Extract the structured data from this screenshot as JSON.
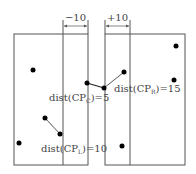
{
  "diagram": {
    "colors": {
      "line": "#555555",
      "point": "#000000",
      "text": "#444444"
    },
    "left_region": {
      "x": 14,
      "y": 34,
      "w": 74,
      "h": 131,
      "strip_x": 63
    },
    "right_region": {
      "x": 105,
      "y": 34,
      "w": 80,
      "h": 131,
      "strip_x": 130
    },
    "dimensions": [
      {
        "label": "−10",
        "x1": 63,
        "x2": 88,
        "y": 26
      },
      {
        "label": "+10",
        "x1": 105,
        "x2": 130,
        "y": 26
      }
    ],
    "labels": {
      "center": {
        "main": "dist(CP",
        "sub": "C",
        "tail": ")=5"
      },
      "right": {
        "main": "dist(CP",
        "sub": "R",
        "tail": ")=15"
      },
      "left": {
        "main": "dist(CP",
        "sub": "L",
        "tail": ")=10"
      }
    },
    "points": [
      {
        "x": 33,
        "y": 70
      },
      {
        "x": 87,
        "y": 83
      },
      {
        "x": 104,
        "y": 88
      },
      {
        "x": 124,
        "y": 72
      },
      {
        "x": 174,
        "y": 80
      },
      {
        "x": 176,
        "y": 46
      },
      {
        "x": 45,
        "y": 118
      },
      {
        "x": 60,
        "y": 134
      },
      {
        "x": 19,
        "y": 143
      },
      {
        "x": 122,
        "y": 146
      }
    ],
    "pairs": [
      {
        "name": "CP_C",
        "a": [
          87,
          83
        ],
        "b": [
          104,
          88
        ]
      },
      {
        "name": "CP_R",
        "a": [
          104,
          88
        ],
        "b": [
          124,
          72
        ]
      },
      {
        "name": "CP_L",
        "a": [
          45,
          118
        ],
        "b": [
          60,
          134
        ]
      }
    ]
  }
}
